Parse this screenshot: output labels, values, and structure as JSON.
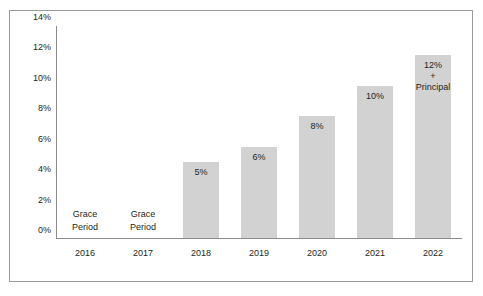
{
  "chart_data": {
    "type": "bar",
    "title": "",
    "xlabel": "",
    "ylabel": "",
    "categories": [
      "2016",
      "2017",
      "2018",
      "2019",
      "2020",
      "2021",
      "2022"
    ],
    "values": [
      0,
      0,
      5,
      6,
      8,
      10,
      12
    ],
    "bar_labels": [
      "",
      "",
      "5%",
      "6%",
      "8%",
      "10%",
      "12%\n+\nPrincipal"
    ],
    "annotations": [
      {
        "category": "2016",
        "text": "Grace\nPeriod",
        "line1": "Grace",
        "line2": "Period"
      },
      {
        "category": "2017",
        "text": "Grace\nPeriod",
        "line1": "Grace",
        "line2": "Period"
      }
    ],
    "ylim": [
      0,
      14
    ],
    "ytick_values": [
      0,
      2,
      4,
      6,
      8,
      10,
      12,
      14
    ],
    "ytick_labels": [
      "0%",
      "2%",
      "4%",
      "6%",
      "8%",
      "10%",
      "12%",
      "14%"
    ],
    "grid": false,
    "legend": "none",
    "bar_color": "#d2d2d2",
    "axis_color": "#8c8c8c",
    "text_color": "#231f20",
    "border_color": "#9a9a9a"
  },
  "bars": [
    {
      "category": "2016",
      "value": 0,
      "label": "",
      "label_lines": [],
      "grace": true,
      "grace_line1": "Grace",
      "grace_line2": "Period"
    },
    {
      "category": "2017",
      "value": 0,
      "label": "",
      "label_lines": [],
      "grace": true,
      "grace_line1": "Grace",
      "grace_line2": "Period"
    },
    {
      "category": "2018",
      "value": 5,
      "label": "5%",
      "label_lines": [
        "5%"
      ],
      "grace": false
    },
    {
      "category": "2019",
      "value": 6,
      "label": "6%",
      "label_lines": [
        "6%"
      ],
      "grace": false
    },
    {
      "category": "2020",
      "value": 8,
      "label": "8%",
      "label_lines": [
        "8%"
      ],
      "grace": false
    },
    {
      "category": "2021",
      "value": 10,
      "label": "10%",
      "label_lines": [
        "10%"
      ],
      "grace": false
    },
    {
      "category": "2022",
      "value": 12,
      "label": "12% + Principal",
      "label_lines": [
        "12%",
        "+",
        "Principal"
      ],
      "grace": false
    }
  ]
}
